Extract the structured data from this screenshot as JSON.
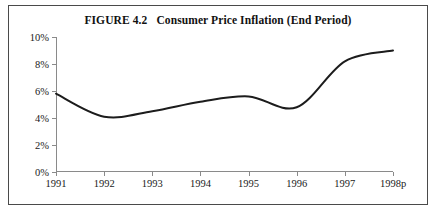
{
  "figure": {
    "number": "FIGURE 4.2",
    "title": "Consumer Price Inflation (End Period)"
  },
  "chart_data": {
    "type": "line",
    "xlabel": "",
    "ylabel": "",
    "categories": [
      "1991",
      "1992",
      "1993",
      "1994",
      "1995",
      "1996",
      "1997",
      "1998p"
    ],
    "values": [
      5.8,
      4.1,
      4.5,
      5.2,
      5.6,
      4.8,
      8.2,
      9.0
    ],
    "ylim": [
      0,
      10
    ],
    "yticks": [
      0,
      2,
      4,
      6,
      8,
      10
    ],
    "ytick_labels": [
      "0%",
      "2%",
      "4%",
      "6%",
      "8%",
      "10%"
    ],
    "xtick_labels": [
      "1991",
      "1992",
      "1993",
      "1994",
      "1995",
      "1996",
      "1997",
      "1998p"
    ],
    "grid": false,
    "legend": null,
    "series_color": "#1c1c1c",
    "units": "percent"
  }
}
